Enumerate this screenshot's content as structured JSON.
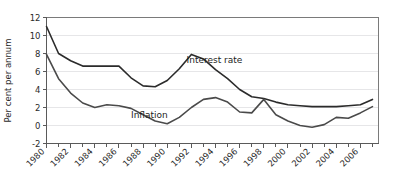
{
  "chart_data": {
    "type": "line",
    "title": "",
    "xlabel": "",
    "ylabel": "Per cent per annum",
    "ylim": [
      -2,
      12
    ],
    "xlim": [
      1980,
      2007.5
    ],
    "ytick_labels": [
      "12",
      "10",
      "8",
      "6",
      "4",
      "2",
      "0",
      "-2"
    ],
    "ytick_values": [
      12,
      10,
      8,
      6,
      4,
      2,
      0,
      -2
    ],
    "xtick_labels": [
      "1980",
      "1982",
      "1984",
      "1986",
      "1988",
      "1990",
      "1992",
      "1994",
      "1996",
      "1998",
      "2000",
      "2002",
      "2004",
      "2006"
    ],
    "xtick_values": [
      1980,
      1982,
      1984,
      1986,
      1988,
      1990,
      1992,
      1994,
      1996,
      1998,
      2000,
      2002,
      2004,
      2006
    ],
    "minor_xticks": [
      1981,
      1983,
      1985,
      1987,
      1989,
      1991,
      1993,
      1995,
      1997,
      1999,
      2001,
      2003,
      2005,
      2007
    ],
    "grid": true,
    "grid_axis": "y",
    "legend_position": "inline-annotation",
    "x": [
      1980,
      1981,
      1982,
      1983,
      1984,
      1985,
      1986,
      1987,
      1988,
      1989,
      1990,
      1991,
      1992,
      1993,
      1994,
      1995,
      1996,
      1997,
      1998,
      1999,
      2000,
      2001,
      2002,
      2003,
      2004,
      2005,
      2006,
      2007
    ],
    "series": [
      {
        "name": "Interest rate",
        "color": "#2b2b2b",
        "values": [
          11.0,
          8.0,
          7.2,
          6.6,
          6.6,
          6.6,
          6.6,
          5.3,
          4.4,
          4.3,
          5.0,
          6.3,
          7.9,
          7.4,
          6.2,
          5.2,
          4.0,
          3.2,
          3.0,
          2.6,
          2.3,
          2.2,
          2.1,
          2.1,
          2.1,
          2.2,
          2.3,
          2.9
        ]
      },
      {
        "name": "Inflation",
        "color": "#4a4a4a",
        "values": [
          7.9,
          5.2,
          3.6,
          2.5,
          2.0,
          2.3,
          2.2,
          1.9,
          1.2,
          0.5,
          0.2,
          0.9,
          2.0,
          2.9,
          3.1,
          2.6,
          1.5,
          1.4,
          2.9,
          1.2,
          0.5,
          0.0,
          -0.2,
          0.1,
          0.9,
          0.8,
          1.4,
          2.1
        ]
      }
    ],
    "annotations": [
      {
        "text": "Interest rate",
        "x": 1991.6,
        "y": 6.9
      },
      {
        "text": "Inflation",
        "x": 1987.0,
        "y": 0.85
      }
    ],
    "colors": {
      "plot_background": "#ffffff",
      "page_background": "#ffffff",
      "gridline": "#e6e6e8",
      "axis_line": "#5a5a5a",
      "frame": "#7a7a7a",
      "text": "#2b2b2b"
    }
  }
}
